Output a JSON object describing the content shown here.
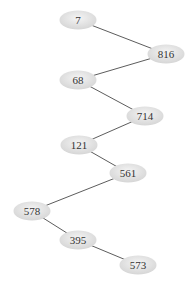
{
  "diagram": {
    "type": "tree",
    "nodes": [
      {
        "id": "n7",
        "label": "7",
        "cx": 78,
        "cy": 20
      },
      {
        "id": "n816",
        "label": "816",
        "cx": 166,
        "cy": 54
      },
      {
        "id": "n68",
        "label": "68",
        "cx": 78,
        "cy": 80
      },
      {
        "id": "n714",
        "label": "714",
        "cx": 145,
        "cy": 116
      },
      {
        "id": "n121",
        "label": "121",
        "cx": 79,
        "cy": 145
      },
      {
        "id": "n561",
        "label": "561",
        "cx": 128,
        "cy": 173
      },
      {
        "id": "n578",
        "label": "578",
        "cx": 32,
        "cy": 211
      },
      {
        "id": "n395",
        "label": "395",
        "cx": 78,
        "cy": 240
      },
      {
        "id": "n573",
        "label": "573",
        "cx": 138,
        "cy": 265
      }
    ],
    "edges": [
      {
        "from": "7",
        "to": "816"
      },
      {
        "from": "816",
        "to": "68"
      },
      {
        "from": "68",
        "to": "714"
      },
      {
        "from": "714",
        "to": "121"
      },
      {
        "from": "121",
        "to": "561"
      },
      {
        "from": "561",
        "to": "578"
      },
      {
        "from": "578",
        "to": "395"
      },
      {
        "from": "395",
        "to": "573"
      }
    ],
    "node_fill": "#e0e0e0",
    "node_fill_highlight": "#f4f4f4",
    "edge_color": "#4a4a4a"
  }
}
